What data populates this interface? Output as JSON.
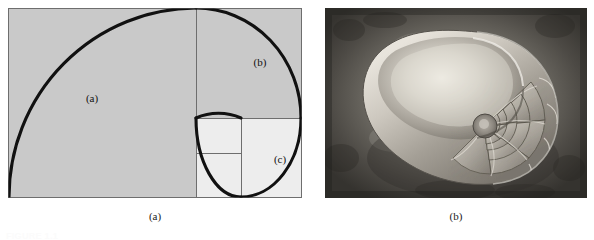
{
  "figure": {
    "number_label": "FIGURE 1.1",
    "panels": [
      {
        "caption": "(a)",
        "kind": "golden-spiral-diagram",
        "labels": [
          {
            "id": "a",
            "text": "(a)"
          },
          {
            "id": "b",
            "text": "(b)"
          },
          {
            "id": "c",
            "text": "(c)"
          }
        ],
        "colors": {
          "fill_large": "#c9c9c9",
          "fill_small": "#ededed",
          "border": "#6e6e6e",
          "spiral": "#111111"
        }
      },
      {
        "caption": "(b)",
        "kind": "nautilus-shell-photograph",
        "colors": {
          "background_dark": "#3a3a38",
          "background_light": "#8e8c86",
          "shell_light": "#dedad2",
          "shell_mid": "#a9a49b",
          "shell_dark": "#6a665f"
        }
      }
    ]
  },
  "captions": {
    "panel_a": "(a)",
    "panel_b": "(b)"
  },
  "diagram": {
    "label_a": "(a)",
    "label_b": "(b)",
    "label_c": "(c)"
  }
}
